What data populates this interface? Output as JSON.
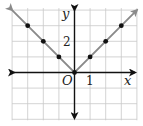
{
  "chart_data": {
    "type": "line",
    "title": "",
    "function": "y = |x|",
    "xlabel": "x",
    "ylabel": "y",
    "origin_label": "O",
    "tick_labels": {
      "x": "1",
      "y": "2"
    },
    "xlim": [
      -4,
      4
    ],
    "ylim": [
      -3,
      4
    ],
    "grid": true,
    "series": [
      {
        "name": "y = |x|",
        "x": [
          -3,
          -2,
          -1,
          0,
          1,
          2,
          3
        ],
        "y": [
          3,
          2,
          1,
          0,
          1,
          2,
          3
        ],
        "markers": true,
        "arrows_both_ends": true
      }
    ]
  },
  "colors": {
    "grid": "#c8c8c8",
    "axes": "#111111",
    "line": "#8a8a8a",
    "points": "#111111"
  }
}
